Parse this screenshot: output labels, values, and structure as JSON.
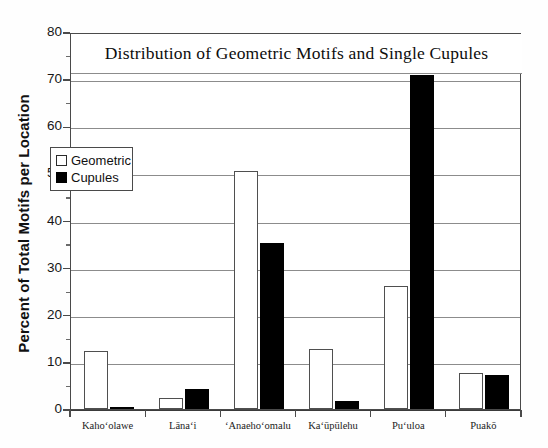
{
  "chart_data": {
    "type": "bar",
    "title": "Distribution of Geometric Motifs and Single Cupules",
    "xlabel": "",
    "ylabel": "Percent of Total Motifs per Location",
    "ylim": [
      0,
      80
    ],
    "yticks": [
      0,
      10,
      20,
      30,
      40,
      50,
      60,
      70,
      80
    ],
    "ytick_labels": [
      "0",
      "10",
      "20",
      "30",
      "40",
      "50",
      "60",
      "70",
      "80"
    ],
    "grid": true,
    "legend_position": "upper-left-inside",
    "categories": [
      "Kahoʻolawe",
      "Lānaʻi",
      "ʻAnaehoʻomalu",
      "Kaʻūpūlehu",
      "Puʻuloa",
      "Puakō"
    ],
    "series": [
      {
        "name": "Geometric",
        "color": "#ffffff",
        "edge_color": "#4f4f4f",
        "values": [
          12.3,
          2.3,
          50.5,
          12.7,
          26.2,
          7.7
        ]
      },
      {
        "name": "Cupules",
        "color": "#000000",
        "edge_color": "#000000",
        "values": [
          0.5,
          4.3,
          35.3,
          1.8,
          70.8,
          7.2
        ]
      }
    ]
  },
  "legend": {
    "items": [
      {
        "label": "Geometric",
        "swatch": "open-square"
      },
      {
        "label": "Cupules",
        "swatch": "filled-square"
      }
    ]
  },
  "colors": {
    "geometric_fill": "#ffffff",
    "cupules_fill": "#000000",
    "axis": "#4a4a4a",
    "gridline": "#8c8c8c",
    "text": "#111111"
  }
}
